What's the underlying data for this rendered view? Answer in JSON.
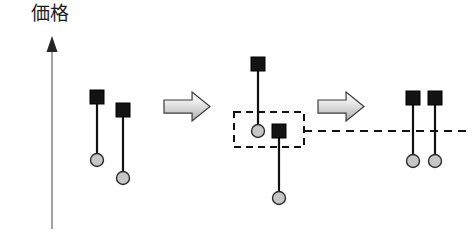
{
  "figure": {
    "title": "",
    "axis": {
      "label": "価格",
      "label_x": 31,
      "label_y": 3,
      "line_x": 52,
      "line_top": 44,
      "line_bottom": 229,
      "arrowhead": "up-arrow-icon",
      "color": "#8c8c8c",
      "width": 1.6
    },
    "colors": {
      "square_fill": "#131313",
      "square_stroke": "#000000",
      "circle_fill": "#c6c6c6",
      "circle_stroke": "#2b2b2b",
      "stem": "#101010",
      "dashed": "#111111",
      "block_arrow_stroke": "#3b3b3b",
      "block_arrow_fill_light": "#f2f2f2",
      "block_arrow_fill_dark": "#b8b8b8",
      "background": "#ffffff"
    },
    "marker_geometry": {
      "square_size": 14,
      "circle_diameter": 13,
      "stem_width": 2.2
    },
    "groups": [
      {
        "name": "group-before",
        "markers": [
          {
            "name": "marker-1",
            "x": 97,
            "square_cy": 97,
            "circle_cy": 160
          },
          {
            "name": "marker-2",
            "x": 123,
            "square_cy": 110,
            "circle_cy": 178
          }
        ]
      },
      {
        "name": "group-during",
        "markers": [
          {
            "name": "marker-3",
            "x": 258,
            "square_cy": 64,
            "circle_cy": 131
          },
          {
            "name": "marker-4",
            "x": 279,
            "square_cy": 131,
            "circle_cy": 198
          }
        ]
      },
      {
        "name": "group-after",
        "markers": [
          {
            "name": "marker-5",
            "x": 413,
            "square_cy": 98,
            "circle_cy": 161
          },
          {
            "name": "marker-6",
            "x": 435,
            "square_cy": 98,
            "circle_cy": 161
          }
        ]
      }
    ],
    "dashed_box": {
      "name": "match-highlight-box",
      "x": 234,
      "y": 112,
      "width": 70,
      "height": 35,
      "dash": "7 5",
      "stroke_width": 2
    },
    "dashed_level_line": {
      "name": "price-level-line",
      "x1": 304,
      "x2": 470,
      "y": 131,
      "dash": "8 6",
      "stroke_width": 2
    },
    "block_arrows": [
      {
        "name": "block-arrow-1",
        "x": 164,
        "y": 92,
        "width": 46,
        "height": 29
      },
      {
        "name": "block-arrow-2",
        "x": 318,
        "y": 92,
        "width": 46,
        "height": 29
      }
    ]
  }
}
